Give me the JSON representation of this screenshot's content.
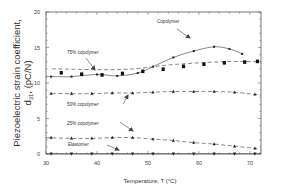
{
  "chart_data": {
    "type": "line",
    "title": "",
    "xlabel": "Temperature, T (°C)",
    "ylabel_line1": "Piezoelectric strain coefficient,",
    "ylabel_line2": "d31, (pC/N)",
    "ylabel_symbol": "d",
    "ylabel_subscript": "31",
    "ylabel_unit": ", (pC/N)",
    "xlim": [
      30,
      72.2
    ],
    "ylim": [
      0,
      20
    ],
    "xticks": [
      30,
      40,
      50,
      60,
      70
    ],
    "yticks": [
      0,
      5,
      10,
      15,
      20
    ],
    "grid": false,
    "legend": "inline annotations with arrows",
    "series": [
      {
        "name": "Copolymer",
        "marker": "small-square",
        "line": "solid",
        "x": [
          31,
          35,
          40,
          44,
          48,
          51,
          55,
          59,
          63,
          66,
          68.5
        ],
        "y": [
          10.9,
          10.9,
          11.2,
          11.0,
          11.4,
          12.3,
          13.6,
          14.5,
          15.1,
          14.8,
          14.1
        ]
      },
      {
        "name": "75% copolymer",
        "marker": "filled-square",
        "line": "dashed",
        "x": [
          33,
          37,
          41,
          45,
          49,
          53,
          57,
          61,
          65,
          69,
          71.5
        ],
        "y": [
          11.5,
          11.3,
          11.2,
          11.4,
          11.7,
          12.0,
          12.4,
          12.7,
          12.9,
          13.0,
          13.1
        ]
      },
      {
        "name": "50% copolymer",
        "marker": "triangle",
        "line": "dashed",
        "x": [
          31,
          35,
          39,
          43,
          47,
          51,
          55,
          59,
          63,
          67,
          71
        ],
        "y": [
          8.5,
          8.5,
          8.5,
          8.6,
          8.6,
          8.7,
          8.8,
          8.8,
          8.8,
          8.7,
          8.4
        ]
      },
      {
        "name": "25% copolymer",
        "marker": "triangle",
        "line": "dashed",
        "x": [
          31,
          35,
          39,
          43,
          47,
          51,
          55,
          59,
          63,
          67,
          71
        ],
        "y": [
          2.3,
          2.2,
          2.2,
          2.3,
          2.3,
          2.1,
          1.9,
          1.6,
          1.4,
          1.1,
          0.8
        ]
      },
      {
        "name": "Elastomer",
        "marker": "inverted-triangle",
        "line": "solid",
        "x": [
          31,
          35,
          39,
          43,
          47,
          51,
          55,
          59,
          63,
          67,
          71
        ],
        "y": [
          0.0,
          0.0,
          0.0,
          0.0,
          0.0,
          0.0,
          0.0,
          0.0,
          0.0,
          0.0,
          0.0
        ]
      }
    ],
    "annotations": [
      {
        "text": "Copolymer",
        "series": "Copolymer"
      },
      {
        "text": "75% copolymer",
        "series": "75% copolymer"
      },
      {
        "text": "50% copolymer",
        "series": "50% copolymer"
      },
      {
        "text": "25% copolymer",
        "series": "25% copolymer"
      },
      {
        "text": "Elastomer",
        "series": "Elastomer"
      }
    ]
  },
  "labels": {
    "copolymer": "Copolymer",
    "c75": "75% copolymer",
    "c50": "50% copolymer",
    "c25": "25% copolymer",
    "elastomer": "Elastomer",
    "xlabel": "Temperature, T (°C)",
    "ylabel1": "Piezoelectric strain coefficient,",
    "ylabel_d": "d",
    "ylabel_sub": "31",
    "ylabel_unit": ", (pC/N)"
  },
  "ticks": {
    "x": [
      "30",
      "40",
      "50",
      "60",
      "70"
    ],
    "y": [
      "0",
      "5",
      "10",
      "15",
      "20"
    ]
  }
}
